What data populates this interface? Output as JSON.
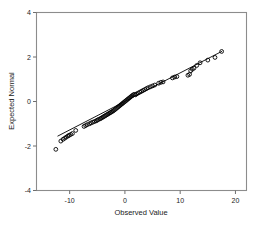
{
  "chart_data": {
    "type": "scatter",
    "title": "",
    "subtitle": "",
    "xlabel": "Observed Value",
    "ylabel": "Expected Normal",
    "xlim": [
      -16,
      22
    ],
    "ylim": [
      -4,
      4
    ],
    "xticks": [
      -10,
      0,
      10,
      20
    ],
    "xtick_labels": [
      "-10",
      "0",
      "10",
      "20"
    ],
    "yticks": [
      4,
      2,
      0,
      -2,
      -4
    ],
    "ytick_labels": [
      "4",
      "2",
      "0",
      "-2",
      "-4"
    ],
    "grid": false,
    "legend": null,
    "marker": "open-circle",
    "series": [
      {
        "name": "Normal Q-Q points",
        "x": [
          -12.5,
          -11.6,
          -11.2,
          -10.9,
          -10.6,
          -10.3,
          -10.1,
          -9.8,
          -9.5,
          -8.9,
          -7.4,
          -7.1,
          -6.8,
          -6.4,
          -6.1,
          -5.8,
          -5.5,
          -5.2,
          -5.0,
          -4.8,
          -4.5,
          -4.3,
          -4.1,
          -3.9,
          -3.7,
          -3.5,
          -3.3,
          -3.1,
          -2.9,
          -2.7,
          -2.5,
          -2.3,
          -2.1,
          -1.9,
          -1.7,
          -1.5,
          -1.3,
          -1.1,
          -0.9,
          -0.7,
          -0.5,
          -0.3,
          -0.1,
          0.1,
          0.3,
          0.5,
          0.7,
          0.9,
          1.1,
          1.3,
          1.5,
          1.7,
          1.9,
          2.1,
          2.4,
          2.7,
          3.0,
          3.3,
          3.6,
          3.9,
          4.2,
          4.6,
          5.0,
          5.4,
          6.1,
          6.5,
          6.9,
          8.6,
          9.0,
          9.4,
          11.4,
          11.7,
          11.9,
          12.2,
          12.5,
          13.0,
          13.6,
          15.0,
          16.3,
          17.5
        ],
        "y": [
          -2.15,
          -1.78,
          -1.7,
          -1.65,
          -1.6,
          -1.55,
          -1.52,
          -1.48,
          -1.44,
          -1.3,
          -1.12,
          -1.08,
          -1.04,
          -1.0,
          -0.96,
          -0.93,
          -0.9,
          -0.87,
          -0.84,
          -0.81,
          -0.78,
          -0.75,
          -0.72,
          -0.69,
          -0.66,
          -0.63,
          -0.6,
          -0.57,
          -0.54,
          -0.51,
          -0.48,
          -0.45,
          -0.42,
          -0.38,
          -0.34,
          -0.3,
          -0.26,
          -0.22,
          -0.18,
          -0.14,
          -0.1,
          -0.06,
          -0.02,
          0.02,
          0.06,
          0.1,
          0.14,
          0.18,
          0.22,
          0.26,
          0.3,
          0.32,
          0.3,
          0.34,
          0.38,
          0.42,
          0.46,
          0.5,
          0.54,
          0.58,
          0.62,
          0.66,
          0.7,
          0.74,
          0.82,
          0.86,
          0.88,
          1.06,
          1.1,
          1.12,
          1.18,
          1.22,
          1.38,
          1.45,
          1.5,
          1.62,
          1.74,
          1.86,
          1.98,
          2.25
        ],
        "color": "#000000"
      }
    ],
    "reference_line": {
      "name": "normal reference line",
      "x0": -12.2,
      "y0": -1.56,
      "x1": 17.6,
      "y1": 2.26,
      "color": "#000000"
    }
  }
}
